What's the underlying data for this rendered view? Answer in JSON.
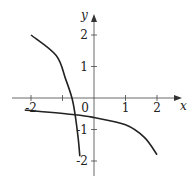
{
  "chart_data": {
    "type": "line",
    "title": "",
    "xlabel": "x",
    "ylabel": "y",
    "xlim": [
      -2.5,
      2.4
    ],
    "ylim": [
      -2.5,
      2.4
    ],
    "x_ticks": [
      -2,
      -1,
      0,
      1,
      2
    ],
    "x_tick_labels": [
      "-2",
      "",
      "0",
      "1",
      "2"
    ],
    "y_ticks": [
      -2,
      -1,
      1,
      2
    ],
    "y_tick_labels": [
      "-2",
      "-1",
      "1",
      "2"
    ],
    "grid": false,
    "series": [
      {
        "name": "steep-curve",
        "points": [
          [
            -2,
            2
          ],
          [
            -1.2,
            1.35
          ],
          [
            -0.9,
            0.6
          ],
          [
            -0.7,
            0
          ],
          [
            -0.6,
            -0.53
          ],
          [
            -0.5,
            -1.3
          ],
          [
            -0.45,
            -1.85
          ]
        ]
      },
      {
        "name": "flat-curve",
        "points": [
          [
            -2.2,
            -0.38
          ],
          [
            -0.6,
            -0.53
          ],
          [
            0,
            -0.62
          ],
          [
            1,
            -0.85
          ],
          [
            1.6,
            -1.25
          ],
          [
            2,
            -1.8
          ]
        ]
      }
    ],
    "color": "#222222"
  }
}
